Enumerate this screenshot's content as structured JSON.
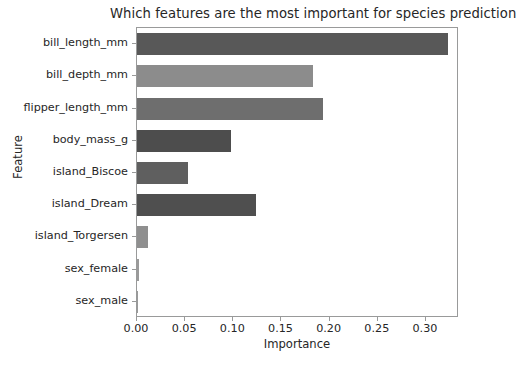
{
  "chart_data": {
    "type": "bar",
    "orientation": "horizontal",
    "title": "Which features are the most important for species prediction",
    "title_truncated": true,
    "xlabel": "Importance",
    "ylabel": "Feature",
    "categories": [
      "bill_length_mm",
      "bill_depth_mm",
      "flipper_length_mm",
      "body_mass_g",
      "island_Biscoe",
      "island_Dream",
      "island_Torgersen",
      "sex_female",
      "sex_male"
    ],
    "values": [
      0.323,
      0.183,
      0.193,
      0.098,
      0.053,
      0.124,
      0.011,
      0.002,
      0.001
    ],
    "bar_colors": [
      "#585858",
      "#8c8c8c",
      "#6e6e6e",
      "#4d4d4d",
      "#5f5f5f",
      "#4f4f4f",
      "#8f8f8f",
      "#9a9a9a",
      "#9a9a9a"
    ],
    "xlim": [
      0.0,
      0.3343
    ],
    "xticks": [
      0.0,
      0.05,
      0.1,
      0.15,
      0.2,
      0.25,
      0.3
    ],
    "xticklabels": [
      "0.00",
      "0.05",
      "0.10",
      "0.15",
      "0.20",
      "0.25",
      "0.30"
    ],
    "grid": false,
    "legend": null
  },
  "style": {
    "background": "#ffffff",
    "axis_color": "#999a9a",
    "text_color": "#262626"
  }
}
